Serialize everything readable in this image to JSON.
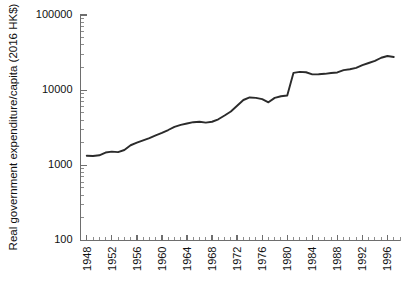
{
  "chart_data": {
    "type": "line",
    "title": "",
    "xlabel": "",
    "ylabel": "Real government expenditure/capita (2016 HK$)",
    "yscale": "log",
    "ylim": [
      100,
      100000
    ],
    "xlim": [
      1947,
      1998
    ],
    "grid": false,
    "legend": null,
    "ytick_labels": [
      "100000",
      "10000",
      "1000",
      "100"
    ],
    "ytick_values": [
      100000,
      10000,
      1000,
      100
    ],
    "xtick_labels": [
      "1948",
      "1952",
      "1956",
      "1960",
      "1964",
      "1968",
      "1972",
      "1976",
      "1980",
      "1984",
      "1988",
      "1992",
      "1996"
    ],
    "xtick_values": [
      1948,
      1952,
      1956,
      1960,
      1964,
      1968,
      1972,
      1976,
      1980,
      1984,
      1988,
      1992,
      1996
    ],
    "minor_xticks_every": 1,
    "series": [
      {
        "name": "Real government expenditure per capita",
        "color": "#2b2b2b",
        "x": [
          1948,
          1949,
          1950,
          1951,
          1952,
          1953,
          1954,
          1955,
          1956,
          1957,
          1958,
          1959,
          1960,
          1961,
          1962,
          1963,
          1964,
          1965,
          1966,
          1967,
          1968,
          1969,
          1970,
          1971,
          1972,
          1973,
          1974,
          1975,
          1976,
          1977,
          1978,
          1979,
          1980,
          1981,
          1982,
          1983,
          1984,
          1985,
          1986,
          1987,
          1988,
          1989,
          1990,
          1991,
          1992,
          1993,
          1994,
          1995,
          1996,
          1997
        ],
        "values": [
          1340,
          1330,
          1360,
          1480,
          1520,
          1500,
          1600,
          1850,
          2000,
          2150,
          2300,
          2500,
          2700,
          2950,
          3250,
          3450,
          3600,
          3750,
          3800,
          3700,
          3800,
          4100,
          4600,
          5200,
          6200,
          7400,
          8000,
          7900,
          7600,
          6900,
          7900,
          8300,
          8500,
          17000,
          17500,
          17300,
          16200,
          16300,
          16500,
          16900,
          17200,
          18500,
          19000,
          19800,
          21500,
          23000,
          24500,
          27000,
          28500,
          27600
        ]
      }
    ]
  },
  "axes": {
    "y_title": "Real government expenditure/capita (2016 HK$)"
  }
}
